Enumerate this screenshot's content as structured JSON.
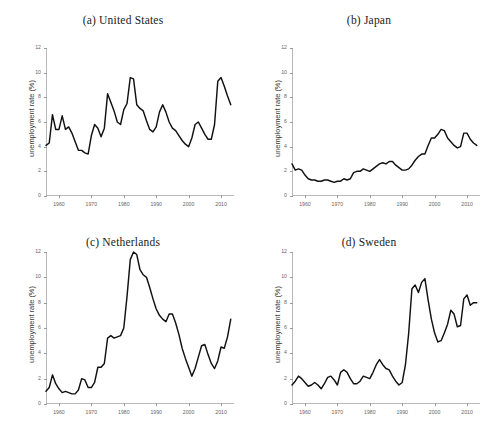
{
  "figure": {
    "ylabel": "unemployment rate (%)",
    "xticks": [
      1960,
      1970,
      1980,
      1990,
      2000,
      2010
    ],
    "yticks": [
      0,
      2,
      4,
      6,
      8,
      10,
      12
    ],
    "xlim": [
      1956,
      2014
    ],
    "ylim": [
      0,
      12
    ],
    "line_color": "#111111",
    "axis_color": "#b9b9b9",
    "background": "#ffffff"
  },
  "chart_data": [
    {
      "type": "line",
      "title": "(a) United States",
      "xlabel": "",
      "ylabel": "unemployment rate (%)",
      "xlim": [
        1956,
        2014
      ],
      "ylim": [
        0,
        12
      ],
      "grid": false,
      "legend": "none",
      "x": [
        1956,
        1957,
        1958,
        1959,
        1960,
        1961,
        1962,
        1963,
        1964,
        1965,
        1966,
        1967,
        1968,
        1969,
        1970,
        1971,
        1972,
        1973,
        1974,
        1975,
        1976,
        1977,
        1978,
        1979,
        1980,
        1981,
        1982,
        1983,
        1984,
        1985,
        1986,
        1987,
        1988,
        1989,
        1990,
        1991,
        1992,
        1993,
        1994,
        1995,
        1996,
        1997,
        1998,
        1999,
        2000,
        2001,
        2002,
        2003,
        2004,
        2005,
        2006,
        2007,
        2008,
        2009,
        2010,
        2011,
        2012,
        2013
      ],
      "values": [
        4.1,
        4.3,
        6.6,
        5.4,
        5.4,
        6.5,
        5.4,
        5.6,
        5.1,
        4.4,
        3.7,
        3.7,
        3.5,
        3.4,
        4.9,
        5.8,
        5.5,
        4.8,
        5.5,
        8.3,
        7.6,
        6.9,
        6.0,
        5.8,
        7.0,
        7.5,
        9.6,
        9.5,
        7.4,
        7.1,
        6.9,
        6.1,
        5.4,
        5.2,
        5.6,
        6.8,
        7.4,
        6.8,
        6.0,
        5.5,
        5.3,
        4.9,
        4.5,
        4.2,
        4.0,
        4.7,
        5.8,
        6.0,
        5.5,
        5.0,
        4.6,
        4.6,
        5.8,
        9.3,
        9.6,
        8.9,
        8.1,
        7.4
      ]
    },
    {
      "type": "line",
      "title": "(b) Japan",
      "xlabel": "",
      "ylabel": "unemployment rate (%)",
      "xlim": [
        1956,
        2014
      ],
      "ylim": [
        0,
        12
      ],
      "grid": false,
      "legend": "none",
      "x": [
        1956,
        1957,
        1958,
        1959,
        1960,
        1961,
        1962,
        1963,
        1964,
        1965,
        1966,
        1967,
        1968,
        1969,
        1970,
        1971,
        1972,
        1973,
        1974,
        1975,
        1976,
        1977,
        1978,
        1979,
        1980,
        1981,
        1982,
        1983,
        1984,
        1985,
        1986,
        1987,
        1988,
        1989,
        1990,
        1991,
        1992,
        1993,
        1994,
        1995,
        1996,
        1997,
        1998,
        1999,
        2000,
        2001,
        2002,
        2003,
        2004,
        2005,
        2006,
        2007,
        2008,
        2009,
        2010,
        2011,
        2012,
        2013
      ],
      "values": [
        2.6,
        2.1,
        2.2,
        2.1,
        1.7,
        1.4,
        1.3,
        1.3,
        1.2,
        1.2,
        1.3,
        1.3,
        1.2,
        1.1,
        1.2,
        1.2,
        1.4,
        1.3,
        1.4,
        1.9,
        2.0,
        2.0,
        2.2,
        2.1,
        2.0,
        2.2,
        2.4,
        2.6,
        2.7,
        2.6,
        2.8,
        2.8,
        2.5,
        2.3,
        2.1,
        2.1,
        2.2,
        2.5,
        2.9,
        3.2,
        3.4,
        3.4,
        4.1,
        4.7,
        4.7,
        5.0,
        5.4,
        5.3,
        4.7,
        4.4,
        4.1,
        3.9,
        4.0,
        5.1,
        5.1,
        4.6,
        4.3,
        4.1
      ]
    },
    {
      "type": "line",
      "title": "(c) Netherlands",
      "xlabel": "",
      "ylabel": "unemployment rate (%)",
      "xlim": [
        1956,
        2014
      ],
      "ylim": [
        0,
        12
      ],
      "grid": false,
      "legend": "none",
      "x": [
        1956,
        1957,
        1958,
        1959,
        1960,
        1961,
        1962,
        1963,
        1964,
        1965,
        1966,
        1967,
        1968,
        1969,
        1970,
        1971,
        1972,
        1973,
        1974,
        1975,
        1976,
        1977,
        1978,
        1979,
        1980,
        1981,
        1982,
        1983,
        1984,
        1985,
        1986,
        1987,
        1988,
        1989,
        1990,
        1991,
        1992,
        1993,
        1994,
        1995,
        1996,
        1997,
        1998,
        1999,
        2000,
        2001,
        2002,
        2003,
        2004,
        2005,
        2006,
        2007,
        2008,
        2009,
        2010,
        2011,
        2012,
        2013
      ],
      "values": [
        1.0,
        1.3,
        2.3,
        1.6,
        1.2,
        0.9,
        1.0,
        0.9,
        0.8,
        0.8,
        1.1,
        2.0,
        1.9,
        1.3,
        1.3,
        1.7,
        2.9,
        2.9,
        3.2,
        5.2,
        5.4,
        5.2,
        5.3,
        5.4,
        6.0,
        8.5,
        11.4,
        12.0,
        11.8,
        10.6,
        10.2,
        10.0,
        9.2,
        8.3,
        7.5,
        7.0,
        6.7,
        6.5,
        7.1,
        7.1,
        6.4,
        5.5,
        4.4,
        3.6,
        2.9,
        2.2,
        2.8,
        3.7,
        4.6,
        4.7,
        3.9,
        3.2,
        2.8,
        3.4,
        4.5,
        4.4,
        5.3,
        6.7
      ]
    },
    {
      "type": "line",
      "title": "(d) Sweden",
      "xlabel": "",
      "ylabel": "unemployment rate (%)",
      "xlim": [
        1956,
        2014
      ],
      "ylim": [
        0,
        12
      ],
      "grid": false,
      "legend": "none",
      "x": [
        1956,
        1957,
        1958,
        1959,
        1960,
        1961,
        1962,
        1963,
        1964,
        1965,
        1966,
        1967,
        1968,
        1969,
        1970,
        1971,
        1972,
        1973,
        1974,
        1975,
        1976,
        1977,
        1978,
        1979,
        1980,
        1981,
        1982,
        1983,
        1984,
        1985,
        1986,
        1987,
        1988,
        1989,
        1990,
        1991,
        1992,
        1993,
        1994,
        1995,
        1996,
        1997,
        1998,
        1999,
        2000,
        2001,
        2002,
        2003,
        2004,
        2005,
        2006,
        2007,
        2008,
        2009,
        2010,
        2011,
        2012,
        2013
      ],
      "values": [
        1.5,
        1.8,
        2.2,
        2.0,
        1.7,
        1.4,
        1.5,
        1.7,
        1.5,
        1.2,
        1.6,
        2.1,
        2.2,
        1.9,
        1.5,
        2.5,
        2.7,
        2.5,
        2.0,
        1.6,
        1.6,
        1.8,
        2.2,
        2.1,
        2.0,
        2.5,
        3.1,
        3.5,
        3.1,
        2.8,
        2.7,
        2.2,
        1.8,
        1.5,
        1.7,
        3.1,
        5.6,
        9.1,
        9.4,
        8.8,
        9.6,
        9.9,
        8.2,
        6.7,
        5.6,
        4.9,
        5.0,
        5.6,
        6.3,
        7.4,
        7.1,
        6.1,
        6.2,
        8.3,
        8.6,
        7.8,
        8.0,
        8.0
      ]
    }
  ]
}
